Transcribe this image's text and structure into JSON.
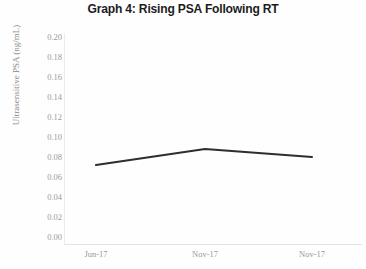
{
  "chart_data": {
    "type": "line",
    "title": "Graph 4: Rising PSA Following RT",
    "xlabel": "",
    "ylabel": "Ultrasensitive PSA (ng/mL)",
    "categories": [
      "Jun-17",
      "Nov-17",
      "Nov-17"
    ],
    "series": [
      {
        "name": "Ultrasensitive PSA",
        "values": [
          0.072,
          0.088,
          0.08
        ]
      }
    ],
    "ylim": [
      0.0,
      0.2
    ],
    "ytick_step": 0.02,
    "yticks": [
      "0.20",
      "0.18",
      "0.16",
      "0.14",
      "0.12",
      "0.10",
      "0.08",
      "0.06",
      "0.04",
      "0.02",
      "0.00"
    ],
    "ytick_values": [
      0.2,
      0.18,
      0.16,
      0.14,
      0.12,
      0.1,
      0.08,
      0.06,
      0.04,
      0.02,
      0.0
    ],
    "grid": false,
    "legend": false,
    "markers": false,
    "line_color": "#2e2e2e",
    "axis_color": "#e8e8e8",
    "tick_label_color": "#9a9a9a"
  }
}
